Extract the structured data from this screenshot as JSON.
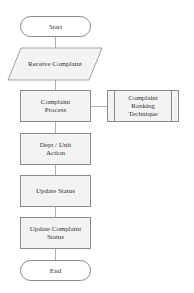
{
  "flowchart": {
    "start": "Start",
    "receive": "Receive Complaint",
    "process": "Complaint Process",
    "ranking": "Complaint Ranking Technique",
    "dept": "Dept / Unit Action",
    "update_status": "Update Status",
    "update_complaint": "Update Complaint Status",
    "end": "End"
  },
  "colors": {
    "box_fill": "#f3f3f3",
    "border": "#8a8a8a",
    "connector": "#b0b0b0"
  }
}
